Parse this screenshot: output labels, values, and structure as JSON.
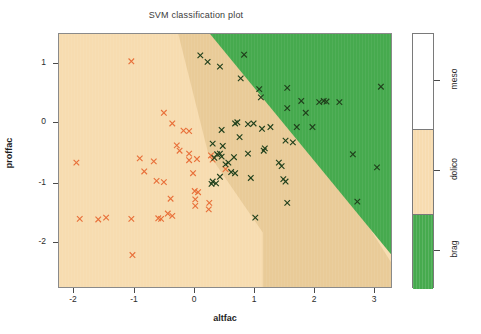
{
  "chart_data": {
    "type": "scatter",
    "title": "SVM classification plot",
    "xlabel": "altfac",
    "ylabel": "proffac",
    "xlim": [
      -2.62,
      3.3
    ],
    "ylim": [
      -2.72,
      1.55
    ],
    "xticks": [
      -2,
      -1,
      0,
      1,
      2,
      3
    ],
    "xticklabels": [
      "-2",
      "-1",
      "0",
      "1",
      "2",
      "3"
    ],
    "yticks": [
      1,
      0,
      -1,
      -2
    ],
    "yticklabels": [
      "1",
      "0",
      "-1",
      "-2"
    ],
    "grid": false,
    "legend_position": "right",
    "legend": {
      "title": "",
      "entries": [
        {
          "label": "meso",
          "color": "#ffffff"
        },
        {
          "label": "dolico",
          "color": "#f7dcb0"
        },
        {
          "label": "brag",
          "color": "#46aa4e"
        }
      ]
    },
    "regions": [
      {
        "name": "dolico-region",
        "color": "#f7dcb0",
        "note": "decision area left/lower of boundary"
      },
      {
        "name": "dolico-margin-region",
        "color": "#e9cb98",
        "note": "darker shaded margin band"
      },
      {
        "name": "brag-region",
        "color": "#46aa4e",
        "note": "decision area upper-right of boundary"
      }
    ],
    "marker_symbol": "x",
    "series": [
      {
        "name": "dolico",
        "color": "#e8703a",
        "points": [
          [
            -1.33,
            1.09
          ],
          [
            -0.75,
            0.22
          ],
          [
            -0.6,
            0.04
          ],
          [
            -0.47,
            -0.42
          ],
          [
            -1.18,
            -0.55
          ],
          [
            -1.1,
            -0.77
          ],
          [
            -0.93,
            -0.6
          ],
          [
            -0.88,
            -0.93
          ],
          [
            -0.75,
            -0.95
          ],
          [
            -0.52,
            -0.33
          ],
          [
            -0.4,
            -0.08
          ],
          [
            -0.3,
            -0.09
          ],
          [
            -0.3,
            -0.47
          ],
          [
            -0.23,
            -0.8
          ],
          [
            -0.2,
            -1.1
          ],
          [
            -0.19,
            -1.24
          ],
          [
            -0.19,
            -1.35
          ],
          [
            -0.14,
            -1.12
          ],
          [
            -0.63,
            -1.23
          ],
          [
            -0.68,
            -1.48
          ],
          [
            -0.6,
            -1.52
          ],
          [
            -2.31,
            -0.62
          ],
          [
            -1.78,
            -1.55
          ],
          [
            -1.92,
            -1.58
          ],
          [
            -2.25,
            -1.57
          ],
          [
            -1.33,
            -1.57
          ],
          [
            -0.85,
            -1.56
          ],
          [
            -0.8,
            -1.57
          ],
          [
            -1.31,
            -2.18
          ],
          [
            -0.3,
            -0.58
          ],
          [
            -0.16,
            -0.56
          ],
          [
            0.09,
            -0.5
          ],
          [
            0.12,
            -0.57
          ],
          [
            0.35,
            -0.73
          ],
          [
            0.06,
            -1.3
          ],
          [
            0.05,
            -1.41
          ]
        ]
      },
      {
        "name": "brag",
        "color": "#20401c",
        "points": [
          [
            -0.1,
            1.19
          ],
          [
            0.03,
            1.08
          ],
          [
            0.25,
            1.0
          ],
          [
            0.62,
            0.8
          ],
          [
            0.68,
            1.2
          ],
          [
            0.95,
            0.62
          ],
          [
            0.98,
            0.48
          ],
          [
            1.45,
            0.64
          ],
          [
            1.7,
            0.42
          ],
          [
            2.02,
            0.4
          ],
          [
            2.1,
            0.42
          ],
          [
            2.15,
            0.41
          ],
          [
            2.38,
            0.4
          ],
          [
            3.12,
            0.66
          ],
          [
            1.45,
            0.3
          ],
          [
            1.78,
            0.22
          ],
          [
            1.62,
            -0.02
          ],
          [
            1.9,
            -0.02
          ],
          [
            1.15,
            -0.02
          ],
          [
            0.85,
            0.04
          ],
          [
            0.75,
            0.03
          ],
          [
            0.52,
            0.04
          ],
          [
            0.28,
            -0.07
          ],
          [
            0.56,
            0.06
          ],
          [
            0.6,
            -0.19
          ],
          [
            0.3,
            -0.34
          ],
          [
            0.12,
            -0.3
          ],
          [
            0.2,
            -0.48
          ],
          [
            0.25,
            -0.47
          ],
          [
            1.0,
            -0.05
          ],
          [
            1.42,
            -0.25
          ],
          [
            1.55,
            -0.28
          ],
          [
            1.05,
            -0.38
          ],
          [
            1.03,
            -0.42
          ],
          [
            0.75,
            -0.47
          ],
          [
            0.5,
            -0.53
          ],
          [
            0.28,
            -0.52
          ],
          [
            0.15,
            -0.54
          ],
          [
            0.4,
            -0.62
          ],
          [
            0.35,
            -0.65
          ],
          [
            0.45,
            -0.78
          ],
          [
            0.52,
            -0.8
          ],
          [
            0.25,
            -0.86
          ],
          [
            0.8,
            -0.88
          ],
          [
            1.3,
            -0.62
          ],
          [
            1.35,
            -0.68
          ],
          [
            1.38,
            -0.9
          ],
          [
            1.42,
            -0.94
          ],
          [
            2.62,
            -0.48
          ],
          [
            3.05,
            -0.7
          ],
          [
            2.7,
            -1.28
          ],
          [
            1.45,
            -1.3
          ],
          [
            0.88,
            -1.55
          ],
          [
            0.12,
            -0.94
          ],
          [
            0.1,
            -0.98
          ],
          [
            0.18,
            -0.97
          ]
        ]
      }
    ]
  },
  "axes": {
    "x_ticks": [
      {
        "label": "-2",
        "left": 73
      },
      {
        "label": "-1",
        "left": 134
      },
      {
        "label": "0",
        "left": 194
      },
      {
        "label": "1",
        "left": 254
      },
      {
        "label": "2",
        "left": 314
      },
      {
        "label": "3",
        "left": 374
      }
    ],
    "y_ticks": [
      {
        "label": "1",
        "top": 63
      },
      {
        "label": "0",
        "top": 122
      },
      {
        "label": "-1",
        "top": 183
      },
      {
        "label": "-2",
        "top": 242
      }
    ]
  },
  "legend_bands": [
    {
      "name": "meso",
      "color": "#ffffff",
      "top": 0,
      "height": 95,
      "tick_top": 47
    },
    {
      "name": "dolico",
      "color": "#f7dcb0",
      "top": 95,
      "height": 85,
      "tick_top": 137
    },
    {
      "name": "brag",
      "color": "#46aa4e",
      "top": 180,
      "height": 75,
      "tick_top": 217
    }
  ]
}
